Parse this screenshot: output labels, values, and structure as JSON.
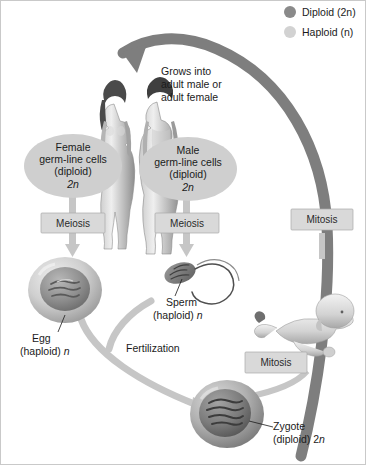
{
  "diagram": {
    "legend": {
      "items": [
        {
          "label": "Diploid (2n)",
          "swatch_color": "#8a8a8a",
          "icon": "filled-circle"
        },
        {
          "label": "Haploid (n)",
          "swatch_color": "#d2d2d2",
          "icon": "filled-circle"
        }
      ]
    },
    "ovals": [
      {
        "id": "female-germ-line",
        "lines": [
          "Female",
          "germ-line cells",
          "(diploid)",
          "2n"
        ],
        "fill": "#cfcfcf"
      },
      {
        "id": "male-germ-line",
        "lines": [
          "Male",
          "germ-line cells",
          "(diploid)",
          "2n"
        ],
        "fill": "#cfcfcf"
      }
    ],
    "process_boxes": [
      {
        "id": "meiosis-female",
        "label": "Meiosis"
      },
      {
        "id": "meiosis-male",
        "label": "Meiosis"
      },
      {
        "id": "mitosis-upper",
        "label": "Mitosis"
      },
      {
        "id": "mitosis-lower",
        "label": "Mitosis"
      }
    ],
    "annotations": {
      "grows_into": [
        "Grows into",
        "adult male or",
        "adult female"
      ],
      "fertilization": "Fertilization"
    },
    "cell_labels": [
      {
        "id": "egg",
        "line1": "Egg",
        "line2": "(haploid) n",
        "ploidy": "haploid"
      },
      {
        "id": "sperm",
        "line1": "Sperm",
        "line2": "(haploid) n",
        "ploidy": "haploid"
      },
      {
        "id": "zygote",
        "line1": "Zygote",
        "line2": "(diploid) 2n",
        "ploidy": "diploid"
      }
    ],
    "figures": [
      {
        "id": "adult-female",
        "name": "adult female human"
      },
      {
        "id": "adult-male",
        "name": "adult male human"
      },
      {
        "id": "infant",
        "name": "crawling infant"
      }
    ],
    "colors": {
      "diploid": "#8a8a8a",
      "haploid": "#d2d2d2",
      "arrow_light": "#c6c6c6",
      "arrow_dark": "#7e7e7e",
      "box_fill": "#d9d9d9",
      "oval_fill": "#cfcfcf",
      "text": "#1b1b1b",
      "background": "#ffffff"
    }
  }
}
